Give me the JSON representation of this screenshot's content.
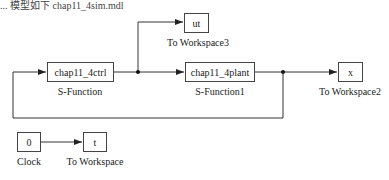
{
  "header": {
    "partial_text": "... 模型如下 chap11_4sim.mdl"
  },
  "blocks": {
    "ctrl": {
      "text": "chap11_4ctrl",
      "label": "S-Function"
    },
    "plant": {
      "text": "chap11_4plant",
      "label": "S-Function1"
    },
    "ut": {
      "text": "ut",
      "label": "To Workspace3"
    },
    "x": {
      "text": "x",
      "label": "To Workspace2"
    },
    "clock": {
      "text": "0",
      "label": "Clock"
    },
    "t": {
      "text": "t",
      "label": "To Workspace"
    }
  },
  "colors": {
    "line": "#333333",
    "border": "#444444"
  }
}
